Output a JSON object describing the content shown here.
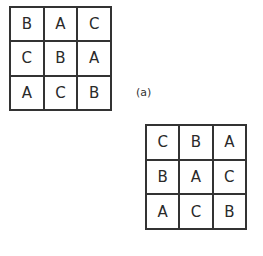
{
  "figure": {
    "label_a": "(a)",
    "grid_a": {
      "rows": [
        [
          "B",
          "A",
          "C"
        ],
        [
          "C",
          "B",
          "A"
        ],
        [
          "A",
          "C",
          "B"
        ]
      ]
    },
    "grid_b": {
      "rows": [
        [
          "C",
          "B",
          "A"
        ],
        [
          "B",
          "A",
          "C"
        ],
        [
          "A",
          "C",
          "B"
        ]
      ]
    }
  }
}
